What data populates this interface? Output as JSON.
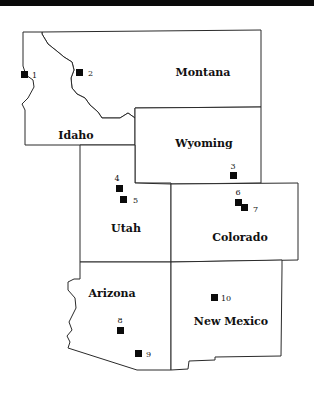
{
  "map": {
    "states": [
      {
        "id": "idaho",
        "label": "Idaho"
      },
      {
        "id": "montana",
        "label": "Montana"
      },
      {
        "id": "wyoming",
        "label": "Wyoming"
      },
      {
        "id": "utah",
        "label": "Utah"
      },
      {
        "id": "colorado",
        "label": "Colorado"
      },
      {
        "id": "arizona",
        "label": "Arizona"
      },
      {
        "id": "new-mexico",
        "label": "New Mexico"
      }
    ],
    "sites": [
      {
        "label": "1",
        "state": "Idaho"
      },
      {
        "label": "2",
        "state": "Montana"
      },
      {
        "label": "3",
        "state": "Wyoming"
      },
      {
        "label": "4",
        "state": "Utah"
      },
      {
        "label": "5",
        "state": "Utah"
      },
      {
        "label": "6",
        "state": "Colorado"
      },
      {
        "label": "7",
        "state": "Colorado"
      },
      {
        "label": "8",
        "state": "Arizona"
      },
      {
        "label": "9",
        "state": "Arizona"
      },
      {
        "label": "10",
        "state": "New Mexico"
      }
    ],
    "colors": {
      "border": "#2a2a2a",
      "marker": "#0b0b0b",
      "fill": "#ffffff"
    }
  }
}
